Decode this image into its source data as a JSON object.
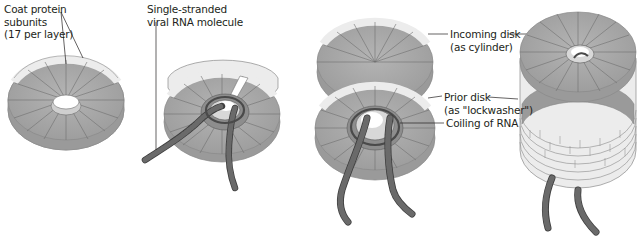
{
  "figure": {
    "colors": {
      "face": "#a7a7a7",
      "face_dark": "#8f8f8f",
      "rim": "#ececec",
      "rim_line": "#8a8a8a",
      "rna": "#5e5e5e",
      "rna_edge": "#3e3e3e",
      "text": "#231f20"
    },
    "panels": [
      {
        "id": "single-disk",
        "labels": [
          {
            "lines": [
              "Coat protein",
              "subunits",
              "(17 per layer)"
            ]
          }
        ]
      },
      {
        "id": "disk-with-rna",
        "labels": [
          {
            "lines": [
              "Single-stranded",
              "viral RNA molecule"
            ]
          }
        ]
      },
      {
        "id": "stacking-disks",
        "labels": [
          {
            "lines": [
              "Incoming disk",
              "(as cylinder)"
            ]
          },
          {
            "lines": [
              "Prior disk",
              "(as \"lockwasher\")"
            ]
          },
          {
            "lines": [
              "Coiling of RNA"
            ]
          }
        ]
      },
      {
        "id": "helical-rod",
        "labels": []
      }
    ]
  }
}
